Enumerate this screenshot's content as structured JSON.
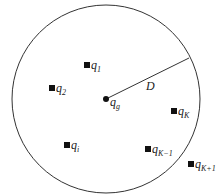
{
  "diagram": {
    "circle": {
      "cx": 106,
      "cy": 99,
      "r": 94
    },
    "center": {
      "name": "q",
      "sub": "g",
      "x": 106,
      "y": 99
    },
    "radius_label": "D",
    "radius_end": {
      "x": 189,
      "y": 58
    },
    "points": [
      {
        "id": "q1",
        "name": "q",
        "sub": "1",
        "x": 87,
        "y": 65
      },
      {
        "id": "q2",
        "name": "q",
        "sub": "2",
        "x": 52,
        "y": 88
      },
      {
        "id": "qi",
        "name": "q",
        "sub": "i",
        "x": 67,
        "y": 145
      },
      {
        "id": "qK",
        "name": "q",
        "sub": "K",
        "x": 174,
        "y": 111
      },
      {
        "id": "qK-1",
        "name": "q",
        "sub": "K−1",
        "x": 148,
        "y": 149
      },
      {
        "id": "qK+1",
        "name": "q",
        "sub": "K+1",
        "x": 191,
        "y": 164
      }
    ]
  }
}
